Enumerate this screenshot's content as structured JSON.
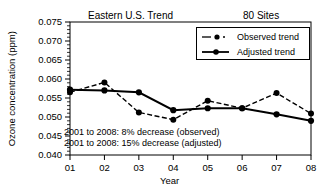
{
  "chart_data": {
    "type": "line",
    "title": "Eastern U.S. Trend",
    "title_right": "80 Sites",
    "xlabel": "Year",
    "ylabel": "Ozone concentration (ppm)",
    "categories": [
      "01",
      "02",
      "03",
      "04",
      "05",
      "06",
      "07",
      "08"
    ],
    "x": [
      2001,
      2002,
      2003,
      2004,
      2005,
      2006,
      2007,
      2008
    ],
    "xlim": [
      2001,
      2008
    ],
    "ylim": [
      0.04,
      0.075
    ],
    "ytick_labels": [
      "0.040",
      "0.045",
      "0.050",
      "0.055",
      "0.060",
      "0.065",
      "0.070",
      "0.075"
    ],
    "ytick_values": [
      0.04,
      0.045,
      0.05,
      0.055,
      0.06,
      0.065,
      0.07,
      0.075
    ],
    "ytick_minor_step": 0.001,
    "grid": false,
    "legend_position": "top-right",
    "series": [
      {
        "name": "Observed trend",
        "style": "dash-dot",
        "marker": "circle",
        "color": "#000000",
        "values": [
          0.0565,
          0.0591,
          0.0512,
          0.0493,
          0.0543,
          0.0523,
          0.0563,
          0.0509
        ]
      },
      {
        "name": "Adjusted trend",
        "style": "solid",
        "marker": "circle",
        "color": "#000000",
        "values": [
          0.0572,
          0.057,
          0.0565,
          0.0518,
          0.0523,
          0.0523,
          0.0507,
          0.049
        ]
      }
    ],
    "annotations": [
      "2001 to 2008: 8% decrease (observed)",
      "2001 to 2008: 15% decrease (adjusted)"
    ]
  }
}
